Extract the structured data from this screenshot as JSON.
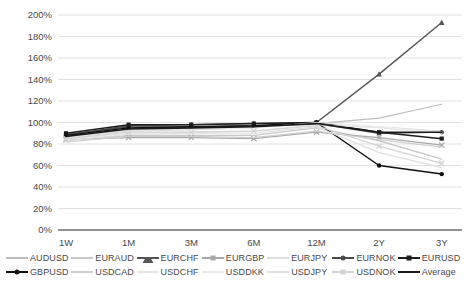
{
  "chart_data": {
    "type": "line",
    "title": "",
    "xlabel": "",
    "ylabel": "",
    "grid": true,
    "legend_position": "bottom",
    "categories": [
      "1W",
      "1M",
      "3M",
      "6M",
      "12M",
      "2Y",
      "3Y"
    ],
    "ylim": [
      0,
      200
    ],
    "yticks": [
      0,
      20,
      40,
      60,
      80,
      100,
      120,
      140,
      160,
      180,
      200
    ],
    "ytick_labels": [
      "0%",
      "20%",
      "40%",
      "60%",
      "80%",
      "100%",
      "120%",
      "140%",
      "160%",
      "180%",
      "200%"
    ],
    "series": [
      {
        "name": "AUDUSD",
        "color": "#bdbdbd",
        "marker": "none",
        "width": 1.2,
        "values": [
          86,
          93,
          94,
          96,
          99,
          104,
          117
        ]
      },
      {
        "name": "EURAUD",
        "color": "#c8c8c8",
        "marker": "none",
        "width": 1.4,
        "values": [
          83,
          88,
          88,
          88,
          95,
          83,
          66
        ]
      },
      {
        "name": "EURCHF",
        "color": "#555555",
        "marker": "triangle",
        "width": 1.4,
        "values": [
          88,
          97,
          98,
          99,
          100,
          145,
          193
        ]
      },
      {
        "name": "EURGBP",
        "color": "#a8a8a8",
        "marker": "cross",
        "width": 1.2,
        "values": [
          84,
          86,
          86,
          85,
          91,
          86,
          79
        ]
      },
      {
        "name": "EURJPY",
        "color": "#dcdcdc",
        "marker": "none",
        "width": 1.2,
        "values": [
          85,
          92,
          93,
          95,
          100,
          96,
          92
        ]
      },
      {
        "name": "EURNOK",
        "color": "#4a4a4a",
        "marker": "dot",
        "width": 1.3,
        "values": [
          89,
          96,
          96,
          97,
          99,
          90,
          91
        ]
      },
      {
        "name": "EURUSD",
        "color": "#1f1f1f",
        "marker": "square",
        "width": 1.5,
        "values": [
          90,
          98,
          98,
          99,
          100,
          91,
          85
        ]
      },
      {
        "name": "GBPUSD",
        "color": "#111111",
        "marker": "dot",
        "width": 1.5,
        "values": [
          88,
          95,
          96,
          97,
          100,
          60,
          52
        ]
      },
      {
        "name": "USDCAD",
        "color": "#cfcfcf",
        "marker": "none",
        "width": 1.3,
        "values": [
          82,
          87,
          87,
          86,
          92,
          84,
          77
        ]
      },
      {
        "name": "USDCHF",
        "color": "#e6e6e6",
        "marker": "none",
        "width": 1.2,
        "values": [
          84,
          90,
          91,
          92,
          98,
          95,
          90
        ]
      },
      {
        "name": "USDDKK",
        "color": "#ebebeb",
        "marker": "none",
        "width": 1.2,
        "values": [
          86,
          93,
          94,
          95,
          100,
          96,
          91
        ]
      },
      {
        "name": "USDJPY",
        "color": "#e0e0e0",
        "marker": "none",
        "width": 1.2,
        "values": [
          83,
          89,
          90,
          90,
          96,
          72,
          58
        ]
      },
      {
        "name": "USDNOK",
        "color": "#d4d4d4",
        "marker": "cross",
        "width": 1.2,
        "values": [
          85,
          91,
          91,
          92,
          97,
          78,
          62
        ]
      },
      {
        "name": "Average",
        "color": "#1a1a1a",
        "marker": "none",
        "width": 1.6,
        "values": [
          87,
          94,
          95,
          96,
          99,
          91,
          91
        ]
      }
    ]
  },
  "legend": {
    "rows": [
      [
        {
          "label": "AUDUSD"
        },
        {
          "label": "EURAUD"
        },
        {
          "label": "EURCHF"
        },
        {
          "label": "EURGBP"
        },
        {
          "label": "EURJPY"
        },
        {
          "label": "EURNOK"
        },
        {
          "label": "EURUSD"
        }
      ],
      [
        {
          "label": "GBPUSD"
        },
        {
          "label": "USDCAD"
        },
        {
          "label": "USDCHF"
        },
        {
          "label": "USDDKK"
        },
        {
          "label": "USDJPY"
        },
        {
          "label": "USDNOK"
        },
        {
          "label": "Average"
        }
      ]
    ]
  },
  "colors": {
    "background": "#ffffff",
    "gridline": "#e2e2e2",
    "axis": "#6e6e6e",
    "text": "#4a4a4a"
  }
}
